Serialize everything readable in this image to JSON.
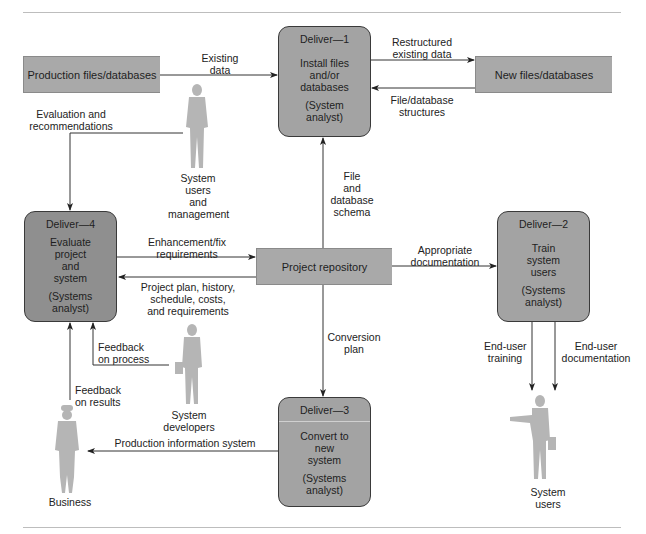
{
  "diagram": {
    "external_stores": {
      "production_files": "Production files/databases",
      "new_files": "New files/databases",
      "project_repository": "Project repository"
    },
    "processes": [
      {
        "id": "deliver-1",
        "header": "Deliver—1",
        "task": [
          "Install files",
          "and/or",
          "databases"
        ],
        "role": [
          "(System",
          "analyst)"
        ]
      },
      {
        "id": "deliver-2",
        "header": "Deliver—2",
        "task": [
          "Train",
          "system",
          "users"
        ],
        "role": [
          "(Systems",
          "analyst)"
        ]
      },
      {
        "id": "deliver-3",
        "header": "Deliver—3",
        "task": [
          "Convert to",
          "new",
          "system"
        ],
        "role": [
          "(Systems",
          "analyst)"
        ]
      },
      {
        "id": "deliver-4",
        "header": "Deliver—4",
        "task": [
          "Evaluate",
          "project",
          "and",
          "system"
        ],
        "role": [
          "(Systems",
          "analyst)"
        ]
      }
    ],
    "actors": {
      "system_users_management": [
        "System",
        "users",
        "and",
        "management"
      ],
      "system_developers": [
        "System",
        "developers"
      ],
      "business": "Business",
      "system_users": [
        "System",
        "users"
      ]
    },
    "flows": {
      "existing_data": [
        "Existing",
        "data"
      ],
      "restructured_existing_data": [
        "Restructured",
        "existing data"
      ],
      "file_database_structures": [
        "File/database",
        "structures"
      ],
      "evaluation_and_recommendations": [
        "Evaluation and",
        "recommendations"
      ],
      "file_and_database_schema": [
        "File",
        "and",
        "database",
        "schema"
      ],
      "enhancement_fix_requirements": [
        "Enhancement/fix",
        "requirements"
      ],
      "project_plan_history": [
        "Project plan, history,",
        "schedule, costs,",
        "and requirements"
      ],
      "appropriate_documentation": [
        "Appropriate",
        "documentation"
      ],
      "conversion_plan": [
        "Conversion",
        "plan"
      ],
      "feedback_on_process": [
        "Feedback",
        "on process"
      ],
      "feedback_on_results": [
        "Feedback",
        "on results"
      ],
      "end_user_training": [
        "End-user",
        "training"
      ],
      "end_user_documentation": [
        "End-user",
        "documentation"
      ],
      "production_information_system": "Production information system"
    },
    "colors": {
      "node_fill": "#a3a3a3",
      "node_fill_dark": "#8f8f8f",
      "store_fill": "#a9a9a9",
      "figure_fill": "#b5b5b5",
      "line": "#333333",
      "rule": "#bdbdbd"
    }
  }
}
